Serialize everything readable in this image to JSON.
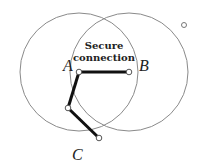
{
  "diagram": {
    "title_lines": [
      "Secure",
      "connection"
    ],
    "nodes": {
      "A": {
        "label": "A",
        "x": 79,
        "y": 72
      },
      "B": {
        "label": "B",
        "x": 129,
        "y": 72
      },
      "mid": {
        "label": "",
        "x": 68,
        "y": 108
      },
      "C": {
        "label": "C",
        "x": 99,
        "y": 138
      },
      "outlier": {
        "label": "",
        "x": 184,
        "y": 25
      }
    },
    "ranges": [
      {
        "name": "range-A",
        "cx": 79,
        "cy": 72,
        "r": 59
      },
      {
        "name": "range-B",
        "cx": 129,
        "cy": 72,
        "r": 59
      }
    ],
    "labels": {
      "A": "A",
      "B": "B",
      "C": "C",
      "secure_line1": "Secure",
      "secure_line2": "connection"
    },
    "colors": {
      "circle": "#8a8a8a",
      "link": "#111111",
      "node_fill": "#ffffff",
      "node_stroke": "#555555",
      "text": "#222222"
    }
  }
}
